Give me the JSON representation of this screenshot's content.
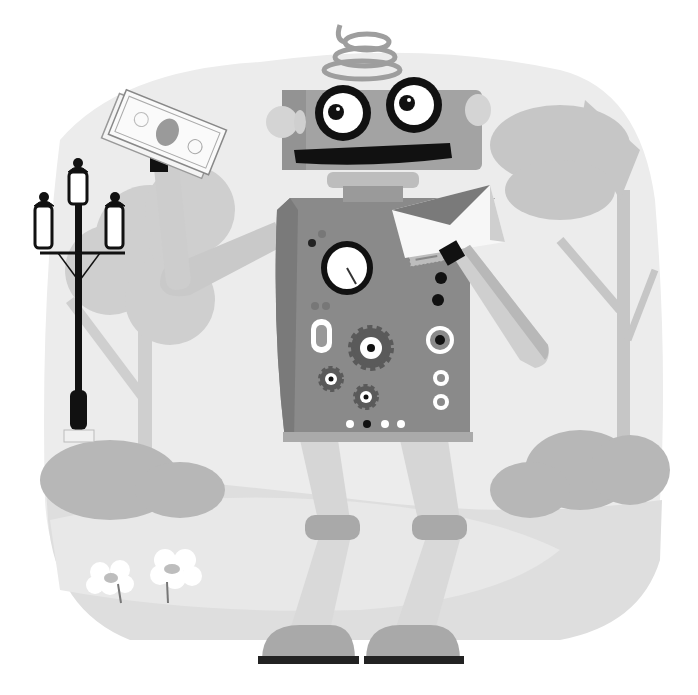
{
  "illustration": {
    "subject": "cartoon robot holding a dollar bill and an envelope in a park",
    "palette": {
      "background": "#ffffff",
      "backdrop": "#ececec",
      "tree": "#c9c9c9",
      "tree_dark": "#bdbdbd",
      "bush": "#b5b5b5",
      "path": "#e3e3e3",
      "ground": "#dedede",
      "body": "#8a8a8a",
      "body_dark": "#6f6f6f",
      "limb": "#d6d6d6",
      "limb_shade": "#bcbcbc",
      "joint": "#a9a9a9",
      "black": "#111111",
      "white": "#ffffff"
    },
    "elements": {
      "robot": "robot",
      "dollar_bill": "dollar bill",
      "envelope": "envelope",
      "street_lamp": "street lamp",
      "flowers": "flowers",
      "trees": "trees",
      "bushes": "bushes"
    }
  }
}
